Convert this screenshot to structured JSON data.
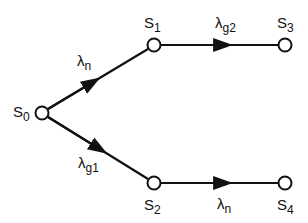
{
  "diagram": {
    "type": "state-transition-graph",
    "nodes": [
      {
        "id": "S0",
        "label": "S",
        "sub": "0",
        "x": 42,
        "y": 113
      },
      {
        "id": "S1",
        "label": "S",
        "sub": "1",
        "x": 154,
        "y": 45
      },
      {
        "id": "S2",
        "label": "S",
        "sub": "2",
        "x": 154,
        "y": 183
      },
      {
        "id": "S3",
        "label": "S",
        "sub": "3",
        "x": 285,
        "y": 45
      },
      {
        "id": "S4",
        "label": "S",
        "sub": "4",
        "x": 285,
        "y": 183
      }
    ],
    "edges": [
      {
        "from": "S0",
        "to": "S1",
        "label": "λ",
        "sub": "n"
      },
      {
        "from": "S0",
        "to": "S2",
        "label": "λ",
        "sub": "g1"
      },
      {
        "from": "S1",
        "to": "S3",
        "label": "λ",
        "sub": "g2"
      },
      {
        "from": "S2",
        "to": "S4",
        "label": "λ",
        "sub": "n"
      }
    ],
    "colors": {
      "line": "#111111",
      "node_fill": "#ffffff",
      "background": "#ffffff"
    }
  }
}
